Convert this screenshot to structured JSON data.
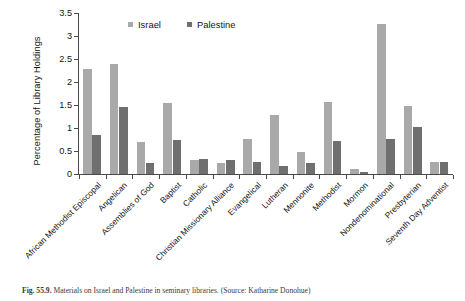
{
  "chart_data": {
    "type": "bar",
    "title": "",
    "xlabel": "",
    "ylabel": "Percentage of Library Holdings",
    "ylim": [
      0,
      3.5
    ],
    "ytick_labels": [
      "3.5",
      "3",
      "2.5",
      "2",
      "1.5",
      "1",
      "0.5",
      "0"
    ],
    "ytick_values": [
      3.5,
      3,
      2.5,
      2,
      1.5,
      1,
      0.5,
      0
    ],
    "grid": false,
    "legend_position": "top-center",
    "categories": [
      "African Methodist Episcopal",
      "Angelican",
      "Assemblies of God",
      "Baptist",
      "Catholic",
      "Christian Missionary Alliance",
      "Evangelical",
      "Lutheran",
      "Mennonite",
      "Methodist",
      "Mormon",
      "Nondenominational",
      "Presbyterian",
      "Seventh Day Adventist"
    ],
    "series": [
      {
        "name": "Israel",
        "color": "#a9a9a9",
        "values": [
          2.28,
          2.4,
          0.7,
          1.55,
          0.3,
          0.25,
          0.76,
          1.29,
          0.48,
          1.56,
          0.11,
          3.27,
          1.48,
          0.27
        ]
      },
      {
        "name": "Palestine",
        "color": "#6f6f6f",
        "values": [
          0.85,
          1.45,
          0.25,
          0.75,
          0.32,
          0.3,
          0.26,
          0.17,
          0.25,
          0.72,
          0.05,
          0.77,
          1.03,
          0.27
        ]
      }
    ]
  },
  "caption": {
    "figure_number": "Fig. 55.9.",
    "text": "Materials on Israel and Palestine in seminary libraries. (Source: Katharine Donohue)"
  }
}
